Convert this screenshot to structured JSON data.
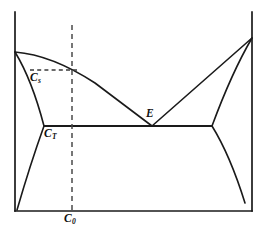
{
  "figure": {
    "type": "binary-eutectic-phase-diagram",
    "background_color": "#ffffff",
    "line_color": "#1a1a1a",
    "guide_color": "#4a4a4a"
  },
  "labels": {
    "solid_composition": {
      "base": "C",
      "subscript": "s"
    },
    "eutectic_temperature_composition": {
      "base": "C",
      "subscript": "T"
    },
    "overall_composition": {
      "base": "C",
      "subscript": "0"
    },
    "eutectic_point": {
      "base": "E",
      "subscript": ""
    }
  },
  "chart_data": {
    "type": "line",
    "title": "",
    "xlabel": "",
    "ylabel": "",
    "grid": false,
    "legend": false,
    "axes": {
      "left_axis": {
        "x": 15,
        "y_top": 12,
        "y_bottom": 211
      },
      "right_axis": {
        "x": 252,
        "y_top": 12,
        "y_bottom": 211
      },
      "bottom_axis": {
        "y": 211,
        "x_left": 15,
        "x_right": 252
      }
    },
    "annotations": [
      {
        "name": "solid-composition-label",
        "text": "Cs",
        "x": 30,
        "y": 72
      },
      {
        "name": "eutectic-temperature-label",
        "text": "CT",
        "x": 44,
        "y": 128
      },
      {
        "name": "overall-composition-label",
        "text": "C0",
        "x": 64,
        "y": 213
      },
      {
        "name": "eutectic-point-label",
        "text": "E",
        "x": 146,
        "y": 108
      }
    ],
    "series": [
      {
        "name": "liquidus-left",
        "description": "Liquidus curve from left pure-component melting point down to eutectic point E",
        "path": "M 15 52 Q 52 55 95 83 L 152 126"
      },
      {
        "name": "liquidus-right",
        "description": "Liquidus curve from eutectic point E up to right pure-component melting point",
        "path": "M 152 126 L 252 38"
      },
      {
        "name": "solidus-left",
        "description": "Solidus curve from left melting point down to left end of eutectic isotherm",
        "path": "M 15 52 Q 32 80 44 126"
      },
      {
        "name": "solidus-right",
        "description": "Solidus curve from right melting point down to right end of eutectic isotherm",
        "path": "M 252 38 Q 232 72 212 126"
      },
      {
        "name": "eutectic-isotherm",
        "description": "Horizontal eutectic invariant line through E",
        "path": "M 44 126 L 212 126"
      },
      {
        "name": "solvus-left",
        "description": "Left solvus boundary descending to the baseline",
        "path": "M 44 126 Q 30 165 17 210"
      },
      {
        "name": "solvus-right",
        "description": "Right solvus boundary descending toward the baseline",
        "path": "M 212 126 Q 230 155 245 203"
      }
    ],
    "guides": [
      {
        "name": "composition-vertical-dashed",
        "description": "Vertical dashed line at overall composition C0",
        "path": "M 72 25 L 72 211"
      },
      {
        "name": "tie-line-horizontal-dashed",
        "description": "Short horizontal dashed tie line at the Cs level",
        "path": "M 30 70 L 77 70"
      }
    ]
  }
}
